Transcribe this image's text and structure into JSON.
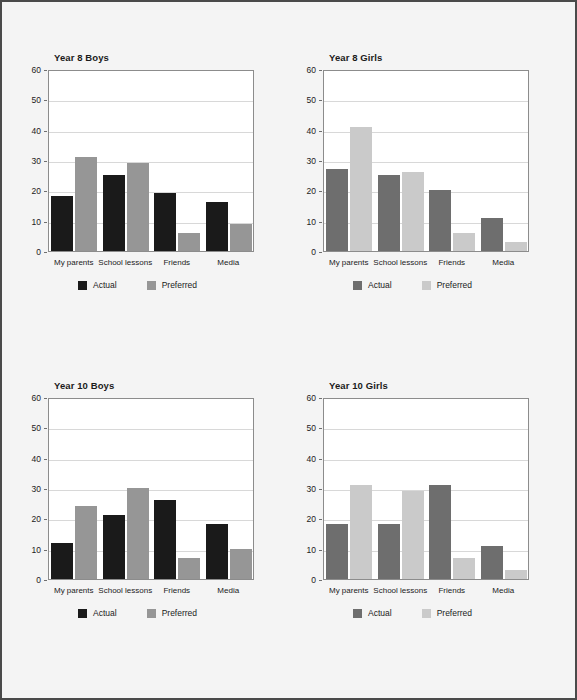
{
  "figure": {
    "background_color": "#f4f4f4",
    "border_color": "#4a4a4a",
    "plot_background": "#ffffff"
  },
  "legend": {
    "actual_label": "Actual",
    "preferred_label": "Preferred"
  },
  "axis": {
    "yticks": [
      0,
      10,
      20,
      30,
      40,
      50,
      60
    ],
    "ymin": 0,
    "ymax": 60
  },
  "chart_data": [
    {
      "type": "bar",
      "title": "Year 8 Boys",
      "categories": [
        "My parents",
        "School lessons",
        "Friends",
        "Media"
      ],
      "series": [
        {
          "name": "Actual",
          "values": [
            18,
            25,
            19,
            16
          ],
          "color": "#1a1a1a"
        },
        {
          "name": "Preferred",
          "values": [
            31,
            29,
            6,
            9
          ],
          "color": "#969696"
        }
      ],
      "xlabel": "",
      "ylabel": "",
      "ylim": [
        0,
        60
      ],
      "yticks": [
        0,
        10,
        20,
        30,
        40,
        50,
        60
      ],
      "grid": true,
      "legend_position": "bottom"
    },
    {
      "type": "bar",
      "title": "Year 8 Girls",
      "categories": [
        "My parents",
        "School lessons",
        "Friends",
        "Media"
      ],
      "series": [
        {
          "name": "Actual",
          "values": [
            27,
            25,
            20,
            11
          ],
          "color": "#6e6e6e"
        },
        {
          "name": "Preferred",
          "values": [
            41,
            26,
            6,
            3
          ],
          "color": "#cacaca"
        }
      ],
      "xlabel": "",
      "ylabel": "",
      "ylim": [
        0,
        60
      ],
      "yticks": [
        0,
        10,
        20,
        30,
        40,
        50,
        60
      ],
      "grid": true,
      "legend_position": "bottom"
    },
    {
      "type": "bar",
      "title": "Year 10 Boys",
      "categories": [
        "My parents",
        "School lessons",
        "Friends",
        "Media"
      ],
      "series": [
        {
          "name": "Actual",
          "values": [
            12,
            21,
            26,
            18
          ],
          "color": "#1a1a1a"
        },
        {
          "name": "Preferred",
          "values": [
            24,
            30,
            7,
            10
          ],
          "color": "#969696"
        }
      ],
      "xlabel": "",
      "ylabel": "",
      "ylim": [
        0,
        60
      ],
      "yticks": [
        0,
        10,
        20,
        30,
        40,
        50,
        60
      ],
      "grid": true,
      "legend_position": "bottom"
    },
    {
      "type": "bar",
      "title": "Year 10 Girls",
      "categories": [
        "My parents",
        "School lessons",
        "Friends",
        "Media"
      ],
      "series": [
        {
          "name": "Actual",
          "values": [
            18,
            18,
            31,
            11
          ],
          "color": "#6e6e6e"
        },
        {
          "name": "Preferred",
          "values": [
            31,
            29,
            7,
            3
          ],
          "color": "#cacaca"
        }
      ],
      "xlabel": "",
      "ylabel": "",
      "ylim": [
        0,
        60
      ],
      "yticks": [
        0,
        10,
        20,
        30,
        40,
        50,
        60
      ],
      "grid": true,
      "legend_position": "bottom"
    }
  ]
}
